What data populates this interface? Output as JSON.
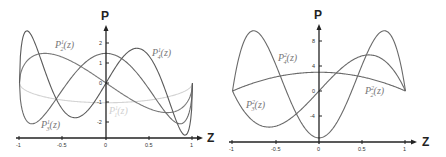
{
  "chart_data": [
    {
      "type": "line",
      "title": "",
      "xlabel": "Z",
      "ylabel": "P",
      "xlim": [
        -1,
        1
      ],
      "ylim": [
        -2.8,
        3
      ],
      "x_ticks": [
        "-1",
        "-0.5",
        "0",
        "0.5",
        "1"
      ],
      "y_ticks": [
        "2",
        "1",
        "0",
        "-1",
        "-2"
      ],
      "grid": false,
      "series": [
        {
          "name": "P_1^1(z)",
          "label": "P₁¹(z)",
          "formula": "-sqrt(1-z^2)",
          "color": "#d4d4d4",
          "x": [
            -1,
            -0.5,
            0,
            0.5,
            1
          ],
          "values": [
            0,
            -0.87,
            -1,
            -0.87,
            0
          ]
        },
        {
          "name": "P_2^1(z)",
          "label": "P₂¹(z)",
          "formula": "-3z*sqrt(1-z^2)",
          "color": "#7a7a7a",
          "x": [
            -1,
            -0.707,
            0,
            0.707,
            1
          ],
          "values": [
            0,
            1.5,
            0,
            -1.5,
            0
          ]
        },
        {
          "name": "P_3^1(z)",
          "label": "P₃¹(z)",
          "formula": "-1.5*(5z^2-1)*sqrt(1-z^2)",
          "color": "#6a6a6a",
          "x": [
            -1,
            -0.8,
            -0.45,
            0,
            0.45,
            0.8,
            1
          ],
          "values": [
            0,
            -1.98,
            0,
            1.5,
            0,
            -1.98,
            0
          ]
        },
        {
          "name": "P_4^1(z)",
          "label": "P₄¹(z)",
          "formula": "-2.5*(7z^3-3z)*sqrt(1-z^2)",
          "color": "#5a5a5a",
          "x": [
            -1,
            -0.88,
            -0.65,
            -0.3,
            0,
            0.3,
            0.65,
            0.88,
            1
          ],
          "values": [
            0,
            2.7,
            0,
            -1.7,
            0,
            1.7,
            0,
            -2.7,
            0
          ]
        }
      ],
      "labels": [
        {
          "text": "P₂¹(z)",
          "series": "P_2^1(z)"
        },
        {
          "text": "P₄¹(z)",
          "series": "P_4^1(z)"
        },
        {
          "text": "P₁¹(z)",
          "series": "P_1^1(z)"
        },
        {
          "text": "P₃¹(z)",
          "series": "P_3^1(z)"
        }
      ]
    },
    {
      "type": "line",
      "title": "",
      "xlabel": "Z",
      "ylabel": "P",
      "xlim": [
        -1,
        1
      ],
      "ylim": [
        -8,
        11
      ],
      "x_ticks": [
        "-1",
        "-0.5",
        "0",
        "0.5",
        "1"
      ],
      "y_ticks": [
        "8",
        "4",
        "0",
        "-4"
      ],
      "grid": false,
      "series": [
        {
          "name": "P_2^2(z)",
          "label": "P₂²(z)",
          "formula": "3(1-z^2)",
          "color": "#6a6a6a",
          "x": [
            -1,
            -0.5,
            0,
            0.5,
            1
          ],
          "values": [
            0,
            2.25,
            3,
            2.25,
            0
          ]
        },
        {
          "name": "P_3^2(z)",
          "label": "P₃²(z)",
          "formula": "15z(1-z^2)",
          "color": "#6a6a6a",
          "x": [
            -1,
            -0.577,
            0,
            0.577,
            1
          ],
          "values": [
            0,
            -5.77,
            0,
            5.77,
            0
          ]
        },
        {
          "name": "P_4^2(z)",
          "label": "P₄²(z)",
          "formula": "7.5(7z^2-1)(1-z^2)",
          "color": "#6a6a6a",
          "x": [
            -1,
            -0.756,
            -0.378,
            0,
            0.378,
            0.756,
            1
          ],
          "values": [
            0,
            9.4,
            0,
            -7.5,
            0,
            9.4,
            0
          ]
        }
      ],
      "labels": [
        {
          "text": "P₄²(z)",
          "series": "P_4^2(z)"
        },
        {
          "text": "P₂²(z)",
          "series": "P_2^2(z)"
        },
        {
          "text": "P₃²(z)",
          "series": "P_3^2(z)"
        }
      ]
    }
  ],
  "left": {
    "axis_y_name": "P",
    "axis_x_name": "Z",
    "x_ticks": [
      "-1",
      "-0.5",
      "0",
      "0.5",
      "1"
    ],
    "y_ticks": [
      "2",
      "1",
      "0",
      "-1",
      "-2"
    ],
    "labels": {
      "p21": {
        "base": "P",
        "sup": "1",
        "sub": "2",
        "arg": "(z)"
      },
      "p41": {
        "base": "P",
        "sup": "1",
        "sub": "4",
        "arg": "(z)"
      },
      "p11": {
        "base": "P",
        "sup": "1",
        "sub": "1",
        "arg": "(z)"
      },
      "p31": {
        "base": "P",
        "sup": "1",
        "sub": "3",
        "arg": "(z)"
      }
    }
  },
  "right": {
    "axis_y_name": "P",
    "axis_x_name": "Z",
    "x_ticks": [
      "-1",
      "-0.5",
      "0",
      "0.5",
      "1"
    ],
    "y_ticks": [
      "8",
      "4",
      "0",
      "-4"
    ],
    "labels": {
      "p42": {
        "base": "P",
        "sup": "2",
        "sub": "4",
        "arg": "(z)"
      },
      "p22": {
        "base": "P",
        "sup": "2",
        "sub": "2",
        "arg": "(z)"
      },
      "p32": {
        "base": "P",
        "sup": "2",
        "sub": "3",
        "arg": "(z)"
      }
    }
  }
}
